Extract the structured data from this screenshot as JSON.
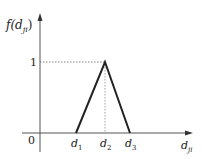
{
  "diagram": {
    "type": "triangular membership function",
    "y_axis_label": "f(d",
    "y_axis_label_sub": "ji",
    "y_axis_label_close": ")",
    "x_axis_label": "d",
    "x_axis_label_sub": "ji",
    "origin_label": "0",
    "peak_value_label": "1",
    "x_ticks": [
      {
        "base": "d",
        "sub": "1"
      },
      {
        "base": "d",
        "sub": "2"
      },
      {
        "base": "d",
        "sub": "3"
      }
    ]
  }
}
